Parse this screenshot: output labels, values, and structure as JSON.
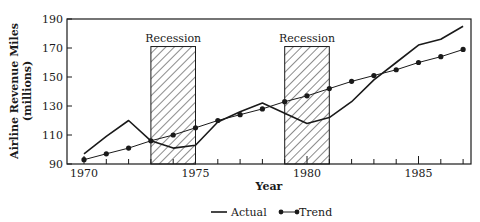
{
  "chart_data": {
    "type": "line",
    "title": "",
    "xlabel": "Year",
    "ylabel": "Airline Revenue Miles",
    "ylabel_sub": "(millions)",
    "x": [
      1970,
      1971,
      1972,
      1973,
      1974,
      1975,
      1976,
      1977,
      1978,
      1979,
      1980,
      1981,
      1982,
      1983,
      1984,
      1985,
      1986,
      1987
    ],
    "xticks": [
      1970,
      1975,
      1980,
      1985
    ],
    "yticks": [
      90,
      110,
      130,
      150,
      170,
      190
    ],
    "xlim": [
      1969.2,
      1987.4
    ],
    "ylim": [
      90,
      190
    ],
    "grid": false,
    "legend_position": "bottom-center",
    "series": [
      {
        "name": "Actual",
        "marker": "none",
        "values": [
          97,
          109,
          120,
          106,
          101,
          103,
          119,
          126,
          132,
          125,
          118,
          122,
          133,
          148,
          160,
          172,
          176,
          185
        ]
      },
      {
        "name": "Trend",
        "marker": "dot",
        "values": [
          93,
          97,
          101,
          106,
          110,
          115,
          120,
          124,
          128,
          133,
          137,
          142,
          147,
          151,
          155,
          160,
          164,
          169
        ]
      }
    ],
    "annotations": [
      {
        "label": "Recession",
        "x_start": 1973.0,
        "x_end": 1975.0,
        "y_top": 171,
        "style": "hatched"
      },
      {
        "label": "Recession",
        "x_start": 1979.0,
        "x_end": 1981.0,
        "y_top": 171,
        "style": "hatched"
      }
    ]
  },
  "legend": {
    "actual": "Actual",
    "trend": "Trend"
  }
}
